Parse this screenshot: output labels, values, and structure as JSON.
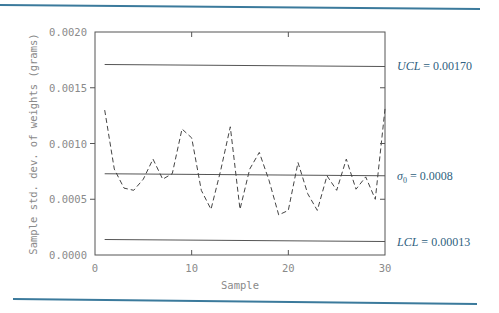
{
  "colors": {
    "rule": "#3b7a9c",
    "frame": "#555555",
    "limit_line": "#555555",
    "data_line": "#444444",
    "tick_text": "#8a8a8a",
    "limit_text": "#2f5f80"
  },
  "chart_data": {
    "type": "line",
    "title": "",
    "xlabel": "Sample",
    "ylabel": "Sample std. dev. of weights (grams)",
    "xlim": [
      0,
      30
    ],
    "ylim": [
      0.0,
      0.002
    ],
    "grid": false,
    "x_ticks": [
      0,
      10,
      20,
      30
    ],
    "x_tick_labels": [
      "0",
      "10",
      "20",
      "30"
    ],
    "y_ticks": [
      0.0,
      0.0005,
      0.001,
      0.0015,
      0.002
    ],
    "y_tick_labels": [
      "0.0000",
      "0.0005",
      "0.0010",
      "0.0015",
      "0.0020"
    ],
    "series": [
      {
        "name": "Sample std. dev.",
        "style": "dashed",
        "x": [
          1,
          2,
          3,
          4,
          5,
          6,
          7,
          8,
          9,
          10,
          11,
          12,
          13,
          14,
          15,
          16,
          17,
          18,
          19,
          20,
          21,
          22,
          23,
          24,
          25,
          26,
          27,
          28,
          29,
          30
        ],
        "values": [
          0.0013,
          0.00077,
          0.0006,
          0.00058,
          0.00068,
          0.00086,
          0.00068,
          0.00073,
          0.00113,
          0.00105,
          0.00058,
          0.00041,
          0.00076,
          0.00115,
          0.00041,
          0.00077,
          0.00092,
          0.00067,
          0.00036,
          0.0004,
          0.00083,
          0.00055,
          0.0004,
          0.00071,
          0.00058,
          0.00086,
          0.00059,
          0.0007,
          0.0005,
          0.00131
        ]
      }
    ],
    "reference_lines": [
      {
        "name": "UCL",
        "value": 0.0017,
        "label_var": "UCL",
        "label_sub": "",
        "label_value": " = 0.00170"
      },
      {
        "name": "center",
        "value": 0.00072,
        "label_var": "σ",
        "label_sub": "0",
        "label_value": " = 0.0008"
      },
      {
        "name": "LCL",
        "value": 0.00013,
        "label_var": "LCL",
        "label_sub": "",
        "label_value": " = 0.00013"
      }
    ],
    "annotations": [
      "UCL = 0.00170",
      "σ0 = 0.0008",
      "LCL = 0.00013"
    ]
  }
}
